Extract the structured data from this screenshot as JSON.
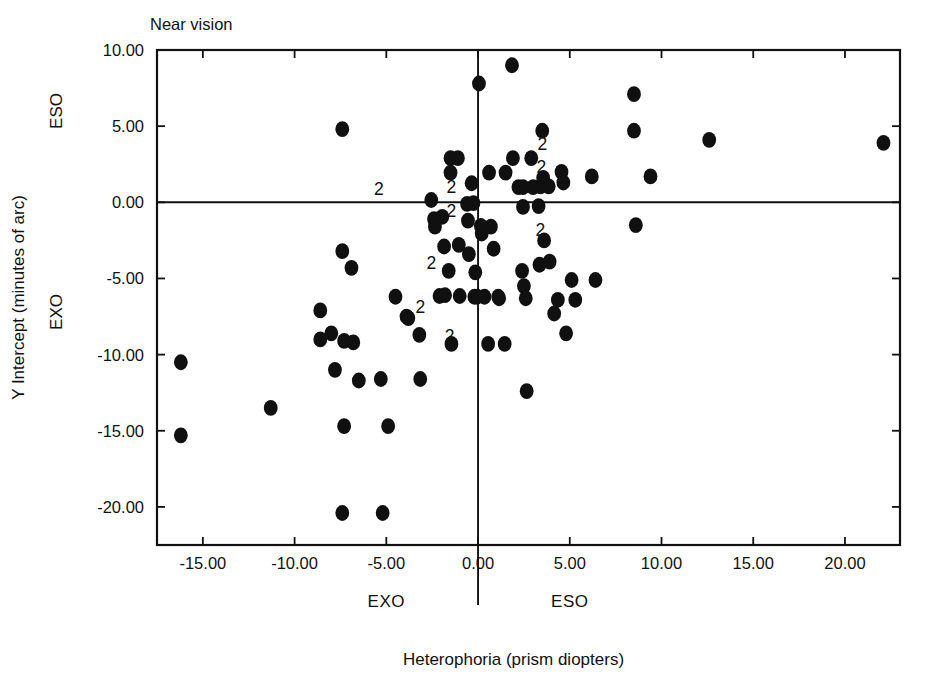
{
  "figure": {
    "panel_title": "Near vision",
    "background": "#ffffff",
    "ink": "#111111"
  },
  "chart_data": {
    "type": "scatter",
    "title": "Near vision",
    "xlabel": "Heterophoria (prism diopters)",
    "ylabel": "Y Intercept (minutes of arc)",
    "xlim": [
      -17.5,
      23.0
    ],
    "ylim": [
      -22.5,
      10.0
    ],
    "xticks": [
      -15.0,
      -10.0,
      -5.0,
      0.0,
      5.0,
      10.0,
      15.0,
      20.0
    ],
    "xtick_labels": [
      "-15.00",
      "-10.00",
      "-5.00",
      "0.00",
      "5.00",
      "10.00",
      "15.00",
      "20.00"
    ],
    "yticks": [
      10.0,
      5.0,
      0.0,
      -5.0,
      -10.0,
      -15.0,
      -20.0
    ],
    "ytick_labels": [
      "10.00",
      "5.00",
      "0.00",
      "-5.00",
      "-10.00",
      "-15.00",
      "-20.00"
    ],
    "grid": false,
    "legend": null,
    "reference_lines": {
      "vertical_x": 0.0,
      "horizontal_y": 0.0
    },
    "axis_region_labels": {
      "y_positive": "ESO",
      "y_negative": "EXO",
      "x_negative": "EXO",
      "x_positive": "ESO"
    },
    "marker": {
      "shape": "circle",
      "color": "#101010",
      "size_px": 15
    },
    "duplicate_annotation": "2",
    "duplicate_note": "Points labeled 2 represent two overlapping observations",
    "duplicate_labels": [
      {
        "x": -5.4,
        "y": 0.85,
        "text": "2"
      },
      {
        "x": -1.45,
        "y": 1.0,
        "text": "2"
      },
      {
        "x": -1.45,
        "y": -0.6,
        "text": "2"
      },
      {
        "x": -2.55,
        "y": -4.0,
        "text": "2"
      },
      {
        "x": -3.15,
        "y": -6.9,
        "text": "2"
      },
      {
        "x": -1.55,
        "y": -8.8,
        "text": "2"
      },
      {
        "x": 3.5,
        "y": 3.8,
        "text": "2"
      },
      {
        "x": 3.45,
        "y": 2.35,
        "text": "2"
      },
      {
        "x": 3.4,
        "y": -1.8,
        "text": "2"
      }
    ],
    "points": [
      {
        "x": -16.2,
        "y": -10.5
      },
      {
        "x": -16.2,
        "y": -15.3
      },
      {
        "x": -11.3,
        "y": -13.5
      },
      {
        "x": -8.6,
        "y": -7.1
      },
      {
        "x": -8.6,
        "y": -9.0
      },
      {
        "x": -8.0,
        "y": -8.6
      },
      {
        "x": -7.8,
        "y": -11.0
      },
      {
        "x": -7.4,
        "y": 4.8
      },
      {
        "x": -7.4,
        "y": -3.2
      },
      {
        "x": -7.3,
        "y": -9.1
      },
      {
        "x": -7.3,
        "y": -14.7
      },
      {
        "x": -7.4,
        "y": -20.4
      },
      {
        "x": -6.9,
        "y": -4.3
      },
      {
        "x": -6.8,
        "y": -9.2
      },
      {
        "x": -6.5,
        "y": -11.7
      },
      {
        "x": -5.3,
        "y": -11.6
      },
      {
        "x": -5.2,
        "y": -20.4
      },
      {
        "x": -4.9,
        "y": -14.7
      },
      {
        "x": -4.5,
        "y": -6.2
      },
      {
        "x": -3.9,
        "y": -7.5
      },
      {
        "x": -3.8,
        "y": -7.6
      },
      {
        "x": -3.2,
        "y": -8.7
      },
      {
        "x": -3.15,
        "y": -11.6
      },
      {
        "x": -2.55,
        "y": 0.15
      },
      {
        "x": -2.4,
        "y": -1.1
      },
      {
        "x": -2.35,
        "y": -1.6
      },
      {
        "x": -2.1,
        "y": -6.15
      },
      {
        "x": -1.95,
        "y": -0.95
      },
      {
        "x": -1.85,
        "y": -2.9
      },
      {
        "x": -1.8,
        "y": -6.1
      },
      {
        "x": -1.6,
        "y": -4.5
      },
      {
        "x": -1.5,
        "y": 1.95
      },
      {
        "x": -1.5,
        "y": 2.9
      },
      {
        "x": -1.45,
        "y": -9.3
      },
      {
        "x": -1.1,
        "y": 2.9
      },
      {
        "x": -1.05,
        "y": -2.8
      },
      {
        "x": -1.0,
        "y": -6.15
      },
      {
        "x": -0.6,
        "y": -0.1
      },
      {
        "x": -0.55,
        "y": -1.2
      },
      {
        "x": -0.5,
        "y": -3.4
      },
      {
        "x": -0.35,
        "y": 1.25
      },
      {
        "x": -0.25,
        "y": -0.05
      },
      {
        "x": -0.2,
        "y": -6.2
      },
      {
        "x": -0.15,
        "y": -4.6
      },
      {
        "x": -0.05,
        "y": -6.2
      },
      {
        "x": 0.05,
        "y": 7.8
      },
      {
        "x": 0.15,
        "y": -1.55
      },
      {
        "x": 0.2,
        "y": -2.05
      },
      {
        "x": 0.35,
        "y": -6.2
      },
      {
        "x": 0.55,
        "y": -9.3
      },
      {
        "x": 0.6,
        "y": 1.95
      },
      {
        "x": 0.7,
        "y": -1.6
      },
      {
        "x": 0.85,
        "y": -3.05
      },
      {
        "x": 1.1,
        "y": -6.2
      },
      {
        "x": 1.15,
        "y": -6.3
      },
      {
        "x": 1.45,
        "y": -9.3
      },
      {
        "x": 1.5,
        "y": 1.95
      },
      {
        "x": 1.85,
        "y": 9.0
      },
      {
        "x": 1.9,
        "y": 2.9
      },
      {
        "x": 2.2,
        "y": 1.0
      },
      {
        "x": 2.4,
        "y": -4.5
      },
      {
        "x": 2.45,
        "y": 1.0
      },
      {
        "x": 2.45,
        "y": -0.3
      },
      {
        "x": 2.5,
        "y": -5.5
      },
      {
        "x": 2.6,
        "y": -6.3
      },
      {
        "x": 2.65,
        "y": -12.4
      },
      {
        "x": 2.9,
        "y": 2.9
      },
      {
        "x": 3.0,
        "y": 1.0
      },
      {
        "x": 3.3,
        "y": -0.25
      },
      {
        "x": 3.35,
        "y": -4.1
      },
      {
        "x": 3.4,
        "y": 1.05
      },
      {
        "x": 3.5,
        "y": 4.7
      },
      {
        "x": 3.55,
        "y": 1.6
      },
      {
        "x": 3.6,
        "y": -2.5
      },
      {
        "x": 3.85,
        "y": 1.05
      },
      {
        "x": 3.9,
        "y": -3.9
      },
      {
        "x": 4.15,
        "y": -7.3
      },
      {
        "x": 4.35,
        "y": -6.4
      },
      {
        "x": 4.55,
        "y": 2.0
      },
      {
        "x": 4.65,
        "y": 1.3
      },
      {
        "x": 4.8,
        "y": -8.6
      },
      {
        "x": 5.1,
        "y": -5.1
      },
      {
        "x": 5.3,
        "y": -6.4
      },
      {
        "x": 6.2,
        "y": 1.7
      },
      {
        "x": 6.4,
        "y": -5.1
      },
      {
        "x": 8.5,
        "y": 7.1
      },
      {
        "x": 8.5,
        "y": 4.7
      },
      {
        "x": 8.6,
        "y": -1.5
      },
      {
        "x": 9.4,
        "y": 1.7
      },
      {
        "x": 12.6,
        "y": 4.1
      },
      {
        "x": 22.1,
        "y": 3.9
      }
    ]
  }
}
